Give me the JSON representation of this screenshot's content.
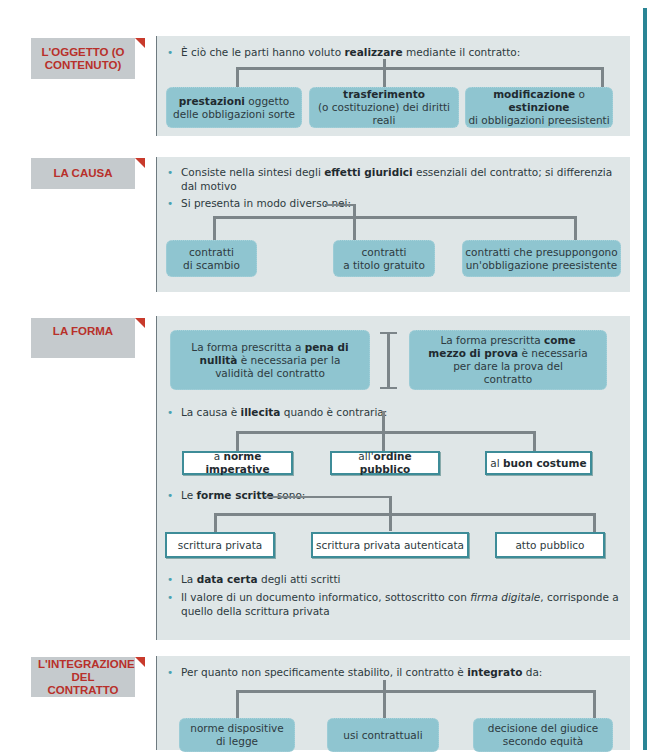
{
  "sections": [
    {
      "label": "L'OGGETTO (O CONTENUTO)",
      "bullets": [
        {
          "pre": "È ciò che le parti hanno voluto ",
          "bold": "realizzare",
          "post": " mediante il contratto:"
        }
      ],
      "boxes": [
        {
          "bold": "prestazioni",
          "text": " oggetto",
          "line2": "delle obbligazioni sorte"
        },
        {
          "bold": "trasferimento",
          "text": "",
          "line2": "(o costituzione) dei diritti reali"
        },
        {
          "bold": "modificazione",
          "text": " o ",
          "bold2": "estinzione",
          "line2": "di obbligazioni preesistenti"
        }
      ]
    },
    {
      "label": "LA CAUSA",
      "bullets": [
        {
          "pre": "Consiste nella sintesi degli ",
          "bold": "effetti giuridici",
          "post": " essenziali del contratto; si differenzia dal motivo"
        },
        {
          "pre": "Si presenta in modo diverso nei:",
          "bold": "",
          "post": ""
        }
      ],
      "boxes": [
        {
          "line1": "contratti",
          "line2": "di scambio"
        },
        {
          "line1": "contratti",
          "line2": "a titolo gratuito"
        },
        {
          "line1": "contratti che presuppongono",
          "line2": "un'obbligazione preesistente"
        }
      ]
    },
    {
      "label": "LA FORMA",
      "forma_boxes": [
        {
          "pre": "La forma prescritta a ",
          "bold": "pena di nullità",
          "post": " è necessaria per la validità del contratto"
        },
        {
          "pre": "La forma prescritta ",
          "bold": "come mezzo di prova",
          "post": " è necessaria per dare la prova del contratto"
        }
      ],
      "bullet_illecita": {
        "pre": "La causa è ",
        "bold": "illecita",
        "post": " quando è contraria:"
      },
      "illecita_boxes": [
        {
          "pre": "a ",
          "bold": "norme imperative"
        },
        {
          "pre": "all'",
          "bold": "ordine pubblico"
        },
        {
          "pre": "al ",
          "bold": "buon costume"
        }
      ],
      "bullet_scritte": {
        "pre": "Le ",
        "bold": "forme scritte",
        "post": " sono:"
      },
      "scritte_boxes": [
        "scrittura privata",
        "scrittura privata autenticata",
        "atto pubblico"
      ],
      "bullet_data": {
        "pre": "La ",
        "bold": "data certa",
        "post": " degli atti scritti"
      },
      "bullet_valore": {
        "pre": "Il valore di un documento informatico, sottoscritto con ",
        "italic": "firma digitale",
        "post": ", corrisponde a quello della scrittura privata"
      }
    },
    {
      "label": "L'INTEGRAZIONE DEL CONTRATTO",
      "bullets": [
        {
          "pre": "Per quanto non specificamente stabilito, il contratto è ",
          "bold": "integrato",
          "post": " da:"
        }
      ],
      "boxes": [
        {
          "line1": "norme dispositive",
          "line2": "di legge"
        },
        {
          "line1": "usi contrattuali",
          "line2": ""
        },
        {
          "line1": "decisione del giudice",
          "line2": "secondo equità"
        }
      ]
    }
  ]
}
